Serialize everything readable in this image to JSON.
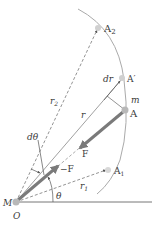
{
  "figure": {
    "labels": {
      "A2": "A",
      "A2_sub": "2",
      "A_prime": "A′",
      "dr": "dr",
      "m": "m",
      "A": "A",
      "r2": "r",
      "r2_sub": "2",
      "r": "r",
      "F": "F",
      "d_theta": "dθ",
      "neg_F": "−F",
      "A1": "A",
      "A1_sub": "1",
      "r1": "r",
      "r1_sub": "1",
      "M": "M",
      "O": "O",
      "theta": "θ"
    },
    "colors": {
      "line": "#6a6a6a",
      "arc": "#9a9a9a",
      "arrow": "#7a7a7a",
      "point": "#c8c8c8",
      "text": "#3a3a3a"
    }
  }
}
